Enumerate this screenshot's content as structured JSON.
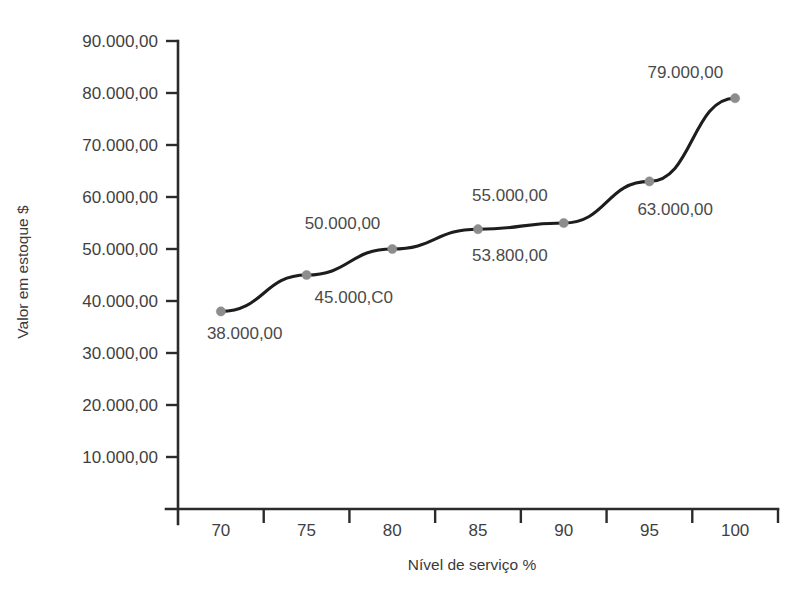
{
  "chart_data": {
    "type": "line",
    "title": "",
    "xlabel": "Nível de serviço %",
    "ylabel": "Valor em estoque $",
    "x": [
      70,
      75,
      80,
      85,
      90,
      95,
      100
    ],
    "values": [
      38000,
      45000,
      50000,
      53800,
      55000,
      63000,
      79000
    ],
    "point_labels": [
      "38.000,00",
      "45.000,C0",
      "50.000,00",
      "53.800,00",
      "55.000,00",
      "63.000,00",
      "79.000,00"
    ],
    "xtick_labels": [
      "70",
      "75",
      "80",
      "85",
      "90",
      "95",
      "100"
    ],
    "ytick_labels": [
      "10.000,00",
      "20.000,00",
      "30.000,00",
      "40.000,00",
      "50.000,00",
      "60.000,00",
      "70.000,00",
      "80.000,00",
      "90.000,00"
    ],
    "ytick_values": [
      10000,
      20000,
      30000,
      40000,
      50000,
      60000,
      70000,
      80000,
      90000
    ],
    "xlim": [
      67.5,
      102.5
    ],
    "ylim": [
      0,
      90000
    ],
    "grid": false,
    "legend": false,
    "series_color": "#1d1d1d",
    "marker_color": "#8d8d8d",
    "axis_color": "#2b2b2b",
    "background_color": "#ffffff"
  }
}
